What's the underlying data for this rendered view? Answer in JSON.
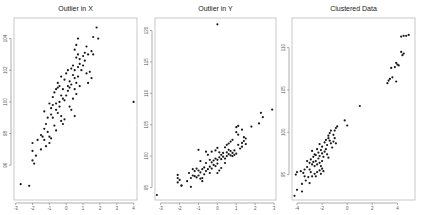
{
  "chart_data": [
    {
      "type": "scatter",
      "title": "Outlier in X",
      "xlabel": "",
      "ylabel": "",
      "xlim": [
        -3.1,
        4.2
      ],
      "ylim": [
        93.8,
        105.3
      ],
      "xticks": [
        -3,
        -2,
        -1,
        0,
        1,
        2,
        3,
        4
      ],
      "yticks": [
        96,
        98,
        100,
        102,
        104
      ],
      "grid": false,
      "legend": null,
      "frame": {
        "left": 14,
        "top": 18,
        "right": 137,
        "bottom": 200
      },
      "points": [
        [
          -2.7,
          94.8
        ],
        [
          -2.2,
          94.7
        ],
        [
          -2.0,
          96.3
        ],
        [
          -1.9,
          96.1
        ],
        [
          -2.0,
          96.9
        ],
        [
          -1.8,
          96.6
        ],
        [
          -1.7,
          97.6
        ],
        [
          -2.0,
          97.4
        ],
        [
          -1.5,
          97.9
        ],
        [
          -1.3,
          97.6
        ],
        [
          -1.4,
          97.8
        ],
        [
          -1.2,
          97.2
        ],
        [
          -1.1,
          98.1
        ],
        [
          -1.0,
          97.8
        ],
        [
          -0.9,
          97.7
        ],
        [
          -1.0,
          97.4
        ],
        [
          -1.2,
          98.6
        ],
        [
          -1.1,
          99.0
        ],
        [
          -1.3,
          99.4
        ],
        [
          -0.9,
          99.2
        ],
        [
          -0.8,
          99.0
        ],
        [
          -0.7,
          98.5
        ],
        [
          -0.6,
          98.2
        ],
        [
          -0.9,
          99.6
        ],
        [
          -0.8,
          99.8
        ],
        [
          -0.6,
          99.5
        ],
        [
          -0.5,
          99.3
        ],
        [
          -0.4,
          99.7
        ],
        [
          -0.3,
          98.8
        ],
        [
          -0.2,
          98.6
        ],
        [
          -0.1,
          98.9
        ],
        [
          -0.3,
          99.1
        ],
        [
          -1.0,
          99.9
        ],
        [
          -0.8,
          100.3
        ],
        [
          -0.7,
          100.6
        ],
        [
          -0.5,
          100.9
        ],
        [
          -0.4,
          101.0
        ],
        [
          -0.3,
          100.4
        ],
        [
          -0.2,
          100.2
        ],
        [
          -0.1,
          100.1
        ],
        [
          0.0,
          100.4
        ],
        [
          0.1,
          100.7
        ],
        [
          0.2,
          99.7
        ],
        [
          0.3,
          99.5
        ],
        [
          0.4,
          100.2
        ],
        [
          0.5,
          99.1
        ],
        [
          0.6,
          100.5
        ],
        [
          0.5,
          100.8
        ],
        [
          -0.5,
          101.2
        ],
        [
          -0.3,
          101.6
        ],
        [
          -0.1,
          101.4
        ],
        [
          0.0,
          101.8
        ],
        [
          0.1,
          102.0
        ],
        [
          0.2,
          101.3
        ],
        [
          0.3,
          101.1
        ],
        [
          0.4,
          101.7
        ],
        [
          0.5,
          101.5
        ],
        [
          0.6,
          101.2
        ],
        [
          0.7,
          101.6
        ],
        [
          0.8,
          101.0
        ],
        [
          0.3,
          102.1
        ],
        [
          0.4,
          102.3
        ],
        [
          0.5,
          102.0
        ],
        [
          0.7,
          102.2
        ],
        [
          0.8,
          102.4
        ],
        [
          0.9,
          102.0
        ],
        [
          1.0,
          102.3
        ],
        [
          1.1,
          102.6
        ],
        [
          1.2,
          101.8
        ],
        [
          1.3,
          101.2
        ],
        [
          1.4,
          101.9
        ],
        [
          1.5,
          101.5
        ],
        [
          0.6,
          102.8
        ],
        [
          0.7,
          103.0
        ],
        [
          0.8,
          102.7
        ],
        [
          1.0,
          102.9
        ],
        [
          1.1,
          103.1
        ],
        [
          1.3,
          103.0
        ],
        [
          1.5,
          103.2
        ],
        [
          1.6,
          103.0
        ],
        [
          0.5,
          103.3
        ],
        [
          0.6,
          103.6
        ],
        [
          0.7,
          104.0
        ],
        [
          1.2,
          103.5
        ],
        [
          1.6,
          104.1
        ],
        [
          1.9,
          104.0
        ],
        [
          1.8,
          104.7
        ],
        [
          -0.6,
          99.9
        ],
        [
          -0.2,
          100.8
        ],
        [
          0.2,
          100.9
        ],
        [
          -0.4,
          100.0
        ],
        [
          -0.6,
          100.8
        ],
        [
          0.1,
          101.0
        ],
        [
          -1.3,
          98.3
        ],
        [
          -1.5,
          97.0
        ],
        [
          4.0,
          100.0
        ]
      ]
    },
    {
      "type": "scatter",
      "title": "Outlier in Y",
      "xlabel": "",
      "ylabel": "",
      "xlim": [
        -3.3,
        3.1
      ],
      "ylim": [
        93.0,
        122.0
      ],
      "xticks": [
        -3,
        -2,
        -1,
        0,
        1,
        2,
        3
      ],
      "yticks": [
        95,
        100,
        105,
        110,
        115,
        120
      ],
      "grid": false,
      "legend": null,
      "frame": {
        "left": 155,
        "top": 18,
        "right": 276,
        "bottom": 200
      },
      "points": [
        [
          -3.2,
          93.8
        ],
        [
          -2.1,
          96.5
        ],
        [
          -2.1,
          97.0
        ],
        [
          -2.1,
          95.8
        ],
        [
          -1.9,
          95.3
        ],
        [
          -1.9,
          95.3
        ],
        [
          -1.4,
          95.1
        ],
        [
          -1.5,
          97.3
        ],
        [
          -1.4,
          96.5
        ],
        [
          -1.3,
          96.9
        ],
        [
          -1.2,
          96.8
        ],
        [
          -1.1,
          96.6
        ],
        [
          -1.0,
          96.9
        ],
        [
          -0.9,
          96.4
        ],
        [
          -0.8,
          96.0
        ],
        [
          -0.8,
          96.5
        ],
        [
          -1.3,
          97.9
        ],
        [
          -1.2,
          97.6
        ],
        [
          -1.1,
          98.0
        ],
        [
          -1.0,
          97.7
        ],
        [
          -0.9,
          97.4
        ],
        [
          -0.8,
          97.9
        ],
        [
          -0.7,
          98.2
        ],
        [
          -0.6,
          97.6
        ],
        [
          -0.5,
          97.9
        ],
        [
          -0.4,
          98.3
        ],
        [
          -0.3,
          98.0
        ],
        [
          -0.2,
          98.6
        ],
        [
          -0.1,
          98.4
        ],
        [
          0.0,
          98.8
        ],
        [
          0.1,
          97.7
        ],
        [
          0.0,
          97.3
        ],
        [
          -0.9,
          99.2
        ],
        [
          -0.6,
          98.9
        ],
        [
          -0.4,
          99.4
        ],
        [
          -0.3,
          99.0
        ],
        [
          -0.2,
          99.3
        ],
        [
          -0.1,
          99.6
        ],
        [
          0.0,
          99.4
        ],
        [
          0.1,
          99.8
        ],
        [
          0.2,
          99.5
        ],
        [
          0.3,
          99.9
        ],
        [
          0.4,
          99.6
        ],
        [
          0.5,
          100.0
        ],
        [
          0.6,
          100.3
        ],
        [
          0.7,
          100.1
        ],
        [
          0.8,
          100.0
        ],
        [
          0.9,
          100.2
        ],
        [
          0.2,
          100.2
        ],
        [
          0.3,
          100.5
        ],
        [
          0.5,
          100.6
        ],
        [
          0.6,
          101.0
        ],
        [
          0.7,
          100.8
        ],
        [
          0.8,
          100.5
        ],
        [
          0.9,
          100.9
        ],
        [
          1.0,
          100.4
        ],
        [
          -1.0,
          101.0
        ],
        [
          -0.6,
          100.7
        ],
        [
          -0.5,
          100.2
        ],
        [
          -0.3,
          100.7
        ],
        [
          -0.1,
          100.9
        ],
        [
          0.0,
          101.3
        ],
        [
          0.1,
          100.6
        ],
        [
          0.4,
          101.4
        ],
        [
          0.5,
          101.8
        ],
        [
          0.6,
          102.0
        ],
        [
          0.7,
          102.3
        ],
        [
          0.8,
          102.6
        ],
        [
          1.1,
          101.8
        ],
        [
          1.2,
          101.2
        ],
        [
          1.3,
          101.5
        ],
        [
          1.3,
          102.1
        ],
        [
          1.4,
          102.4
        ],
        [
          1.5,
          101.9
        ],
        [
          1.4,
          103.0
        ],
        [
          1.5,
          102.8
        ],
        [
          1.1,
          103.4
        ],
        [
          1.0,
          103.8
        ],
        [
          1.3,
          104.2
        ],
        [
          1.0,
          104.6
        ],
        [
          1.1,
          104.8
        ],
        [
          1.8,
          104.7
        ],
        [
          2.2,
          105.2
        ],
        [
          2.4,
          106.2
        ],
        [
          2.3,
          106.9
        ],
        [
          2.9,
          107.4
        ],
        [
          -2.0,
          96.2
        ],
        [
          -1.6,
          96.0
        ],
        [
          -0.7,
          97.1
        ],
        [
          0.2,
          98.1
        ],
        [
          0.4,
          98.9
        ],
        [
          -0.4,
          97.3
        ],
        [
          0.0,
          121.0
        ]
      ]
    },
    {
      "type": "scatter",
      "title": "Clustered Data",
      "xlabel": "",
      "ylabel": "",
      "xlim": [
        -4.4,
        5.4
      ],
      "ylim": [
        92.0,
        113.5
      ],
      "xticks": [
        -4,
        -2,
        0,
        2,
        4
      ],
      "yticks": [
        95,
        100,
        105,
        110
      ],
      "grid": false,
      "legend": null,
      "frame": {
        "left": 292,
        "top": 18,
        "right": 415,
        "bottom": 200
      },
      "points": [
        [
          -4.2,
          92.5
        ],
        [
          -4.0,
          93.2
        ],
        [
          -3.6,
          93.0
        ],
        [
          -3.6,
          93.9
        ],
        [
          -3.3,
          94.3
        ],
        [
          -3.4,
          94.8
        ],
        [
          -3.0,
          94.0
        ],
        [
          -3.1,
          94.7
        ],
        [
          -4.0,
          95.3
        ],
        [
          -4.1,
          95.0
        ],
        [
          -3.7,
          95.4
        ],
        [
          -3.4,
          95.6
        ],
        [
          -3.2,
          95.9
        ],
        [
          -3.0,
          95.6
        ],
        [
          -2.9,
          95.3
        ],
        [
          -2.8,
          94.8
        ],
        [
          -2.6,
          95.1
        ],
        [
          -2.5,
          94.8
        ],
        [
          -2.4,
          95.3
        ],
        [
          -2.2,
          95.5
        ],
        [
          -2.1,
          95.1
        ],
        [
          -2.0,
          95.7
        ],
        [
          -1.9,
          95.4
        ],
        [
          -2.8,
          96.2
        ],
        [
          -2.7,
          96.5
        ],
        [
          -2.6,
          96.0
        ],
        [
          -2.5,
          96.6
        ],
        [
          -2.4,
          96.2
        ],
        [
          -2.3,
          96.9
        ],
        [
          -2.2,
          96.4
        ],
        [
          -2.1,
          96.0
        ],
        [
          -2.0,
          96.6
        ],
        [
          -3.2,
          96.6
        ],
        [
          -3.0,
          96.4
        ],
        [
          -2.9,
          96.8
        ],
        [
          -2.7,
          97.1
        ],
        [
          -2.5,
          97.3
        ],
        [
          -2.3,
          97.6
        ],
        [
          -2.2,
          97.2
        ],
        [
          -2.1,
          97.9
        ],
        [
          -2.0,
          97.5
        ],
        [
          -1.9,
          97.1
        ],
        [
          -1.8,
          97.7
        ],
        [
          -1.7,
          98.0
        ],
        [
          -1.6,
          97.4
        ],
        [
          -1.5,
          97.0
        ],
        [
          -2.4,
          98.0
        ],
        [
          -2.2,
          98.6
        ],
        [
          -2.0,
          98.3
        ],
        [
          -1.8,
          98.8
        ],
        [
          -1.7,
          99.1
        ],
        [
          -1.6,
          98.5
        ],
        [
          -1.5,
          99.3
        ],
        [
          -1.4,
          99.0
        ],
        [
          -1.3,
          98.7
        ],
        [
          -1.1,
          98.9
        ],
        [
          -1.5,
          99.6
        ],
        [
          -1.4,
          99.9
        ],
        [
          -1.3,
          100.2
        ],
        [
          -1.1,
          99.7
        ],
        [
          -1.0,
          100.2
        ],
        [
          -0.9,
          100.5
        ],
        [
          -0.8,
          100.7
        ],
        [
          -1.2,
          98.2
        ],
        [
          -2.8,
          97.8
        ],
        [
          -2.6,
          97.4
        ],
        [
          -3.5,
          95.2
        ],
        [
          -1.0,
          99.3
        ],
        [
          -0.9,
          98.7
        ],
        [
          -0.2,
          101.4
        ],
        [
          0.0,
          100.8
        ],
        [
          1.0,
          103.1
        ],
        [
          3.2,
          105.8
        ],
        [
          3.3,
          106.1
        ],
        [
          3.4,
          106.3
        ],
        [
          3.9,
          106.0
        ],
        [
          3.5,
          107.6
        ],
        [
          3.8,
          107.7
        ],
        [
          3.9,
          108.2
        ],
        [
          4.0,
          108.0
        ],
        [
          4.1,
          107.9
        ],
        [
          4.3,
          109.5
        ],
        [
          4.4,
          109.1
        ],
        [
          4.5,
          109.3
        ],
        [
          4.3,
          111.3
        ],
        [
          4.5,
          111.4
        ],
        [
          4.7,
          111.4
        ],
        [
          4.9,
          111.5
        ],
        [
          3.6,
          106.5
        ]
      ]
    }
  ]
}
